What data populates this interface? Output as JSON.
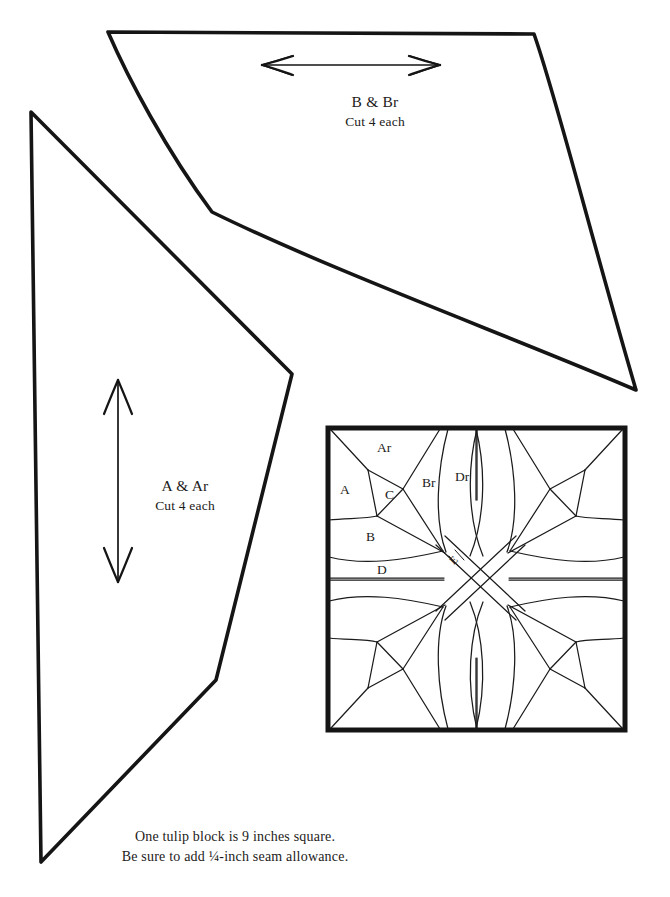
{
  "page": {
    "background": "#ffffff",
    "ink": "#151515",
    "width": 670,
    "height": 897
  },
  "templates": [
    {
      "id": "b",
      "name": "B & Br",
      "label": "B & Br",
      "cut": "Cut 4 each",
      "grainline": "horizontal-double-arrow"
    },
    {
      "id": "a",
      "name": "A & Ar",
      "label": "A & Ar",
      "cut": "Cut 4 each",
      "grainline": "vertical-double-arrow"
    }
  ],
  "block_diagram": {
    "name": "tulip-block",
    "shape": "square",
    "symmetry": "4-way rotational",
    "piece_labels": [
      {
        "text": "A",
        "x": 347,
        "y": 490
      },
      {
        "text": "Ar",
        "x": 386,
        "y": 449
      },
      {
        "text": "B",
        "x": 373,
        "y": 537
      },
      {
        "text": "Br",
        "x": 430,
        "y": 484
      },
      {
        "text": "C",
        "x": 392,
        "y": 495
      },
      {
        "text": "D",
        "x": 383,
        "y": 570
      },
      {
        "text": "Dr",
        "x": 463,
        "y": 478
      },
      {
        "text": "E",
        "x": 455,
        "y": 562,
        "rotated": true
      }
    ]
  },
  "caption": {
    "line1": "One tulip block is 9 inches square.",
    "line2": "Be sure to add ¼-inch seam allowance."
  }
}
